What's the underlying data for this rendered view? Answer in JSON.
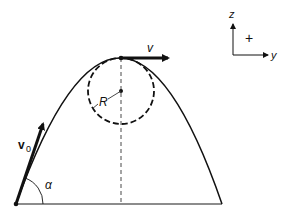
{
  "diagram": {
    "labels": {
      "initial_velocity": "v",
      "initial_velocity_sub": "0",
      "apex_velocity": "v",
      "radius": "R",
      "angle": "α",
      "axis_z": "z",
      "axis_y": "y",
      "sign_convention": "+"
    },
    "points": {
      "launch": [
        16,
        204
      ],
      "apex": [
        121,
        58
      ],
      "landing": [
        222,
        204
      ],
      "circle_center": [
        121,
        91
      ]
    },
    "circle_radius": 33,
    "colors": {
      "stroke": "#111111",
      "ground": "#666666",
      "background": "#ffffff"
    }
  }
}
